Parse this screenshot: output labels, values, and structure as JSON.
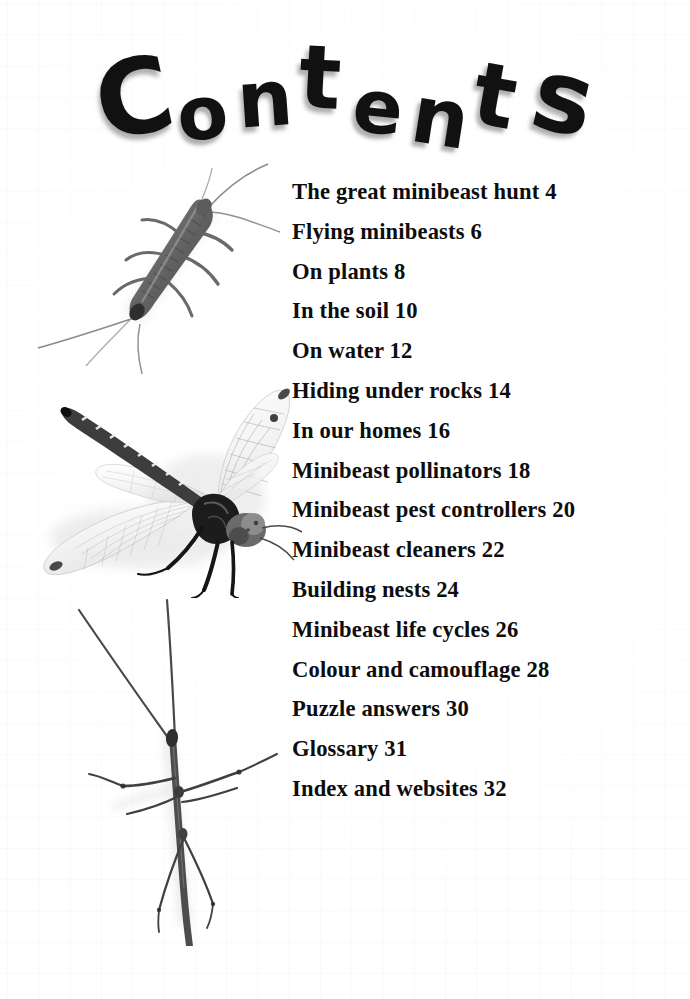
{
  "page": {
    "kind": "book-contents-page",
    "background": "graph-paper",
    "background_color": "#ffffff",
    "grid_line_color": "#f1f1f1",
    "text_color": "#0d0d0d",
    "width": 690,
    "height": 999
  },
  "title": {
    "text": "Contents",
    "style": "hand-drawn rounded sans-serif, letters on a wavy arc with soft drop shadow",
    "letters": [
      {
        "ch": "C",
        "x": 96,
        "y": 28,
        "size": 104,
        "rotate": -12
      },
      {
        "ch": "o",
        "x": 177,
        "y": 58,
        "size": 74,
        "rotate": -6
      },
      {
        "ch": "n",
        "x": 237,
        "y": 42,
        "size": 78,
        "rotate": -4
      },
      {
        "ch": "t",
        "x": 299,
        "y": 16,
        "size": 88,
        "rotate": 3
      },
      {
        "ch": "e",
        "x": 353,
        "y": 52,
        "size": 74,
        "rotate": 6
      },
      {
        "ch": "n",
        "x": 412,
        "y": 60,
        "size": 80,
        "rotate": 9
      },
      {
        "ch": "t",
        "x": 474,
        "y": 34,
        "size": 88,
        "rotate": 10
      },
      {
        "ch": "s",
        "x": 534,
        "y": 30,
        "size": 100,
        "rotate": 13
      }
    ]
  },
  "contents": {
    "entries": [
      {
        "title": "The great minibeast hunt",
        "page": "4",
        "label": "The great minibeast hunt 4"
      },
      {
        "title": "Flying minibeasts",
        "page": "6",
        "label": "Flying minibeasts 6"
      },
      {
        "title": "On plants",
        "page": "8",
        "label": "On plants 8"
      },
      {
        "title": "In the soil",
        "page": "10",
        "label": "In the soil 10"
      },
      {
        "title": "On water",
        "page": "12",
        "label": "On water 12"
      },
      {
        "title": "Hiding under rocks",
        "page": "14",
        "label": "Hiding under rocks 14"
      },
      {
        "title": "In our homes",
        "page": "16",
        "label": "In our homes 16"
      },
      {
        "title": "Minibeast pollinators",
        "page": "18",
        "label": "Minibeast pollinators 18"
      },
      {
        "title": "Minibeast pest controllers",
        "page": "20",
        "label": "Minibeast pest controllers 20"
      },
      {
        "title": "Minibeast cleaners",
        "page": "22",
        "label": "Minibeast cleaners 22"
      },
      {
        "title": "Building nests",
        "page": "24",
        "label": "Building nests 24"
      },
      {
        "title": "Minibeast life cycles",
        "page": "26",
        "label": "Minibeast life cycles 26"
      },
      {
        "title": "Colour and camouflage",
        "page": "28",
        "label": "Colour and camouflage 28"
      },
      {
        "title": "Puzzle answers",
        "page": "30",
        "label": "Puzzle answers 30"
      },
      {
        "title": "Glossary",
        "page": "31",
        "label": "Glossary 31"
      },
      {
        "title": "Index and websites",
        "page": "32",
        "label": "Index and websites 32"
      }
    ]
  },
  "illustrations": [
    {
      "name": "silverfish-photo",
      "subject": "silverfish",
      "description": "grayscale photo of a silverfish, segmented tapering body angled from lower-left to upper-right, three long tail filaments, two antennae, six legs",
      "tone": "grayscale"
    },
    {
      "name": "dragonfly-photo",
      "subject": "dragonfly",
      "description": "grayscale photo of a dragonfly, banded abdomen reaching to upper-left, four translucent veined wings, dark thorax, head with large compound eyes at right, legs hanging below",
      "tone": "grayscale"
    },
    {
      "name": "stick-insect-photo",
      "subject": "stick insect",
      "description": "grayscale photo of a stick insect, very thin vertical body with long slender legs and antennae spreading outward",
      "tone": "grayscale"
    }
  ]
}
